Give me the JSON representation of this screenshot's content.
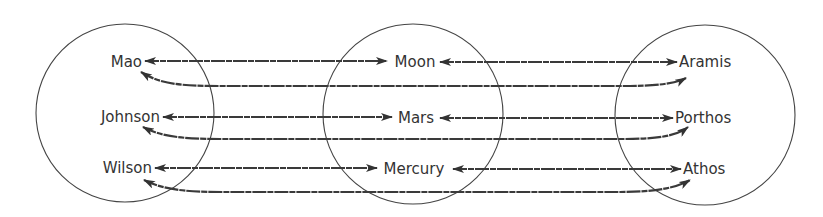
{
  "diagram": {
    "type": "mapping",
    "groups": [
      {
        "name": "left",
        "items": [
          "Mao",
          "Johnson",
          "Wilson"
        ]
      },
      {
        "name": "middle",
        "items": [
          "Moon",
          "Mars",
          "Mercury"
        ]
      },
      {
        "name": "right",
        "items": [
          "Aramis",
          "Porthos",
          "Athos"
        ]
      }
    ],
    "labels": {
      "left": {
        "0": "Mao",
        "1": "Johnson",
        "2": "Wilson"
      },
      "middle": {
        "0": "Moon",
        "1": "Mars",
        "2": "Mercury"
      },
      "right": {
        "0": "Aramis",
        "1": "Porthos",
        "2": "Athos"
      }
    },
    "edges": [
      {
        "from": "Mao",
        "to": "Moon",
        "bidirectional": true
      },
      {
        "from": "Moon",
        "to": "Aramis",
        "bidirectional": true
      },
      {
        "from": "Mao",
        "to": "Aramis",
        "bidirectional": true
      },
      {
        "from": "Johnson",
        "to": "Mars",
        "bidirectional": true
      },
      {
        "from": "Mars",
        "to": "Porthos",
        "bidirectional": true
      },
      {
        "from": "Johnson",
        "to": "Porthos",
        "bidirectional": true
      },
      {
        "from": "Wilson",
        "to": "Mercury",
        "bidirectional": true
      },
      {
        "from": "Mercury",
        "to": "Athos",
        "bidirectional": true
      },
      {
        "from": "Wilson",
        "to": "Athos",
        "bidirectional": true
      }
    ],
    "colors": {
      "stroke": "#3a3a3a",
      "text": "#333333",
      "background": "#ffffff"
    }
  }
}
